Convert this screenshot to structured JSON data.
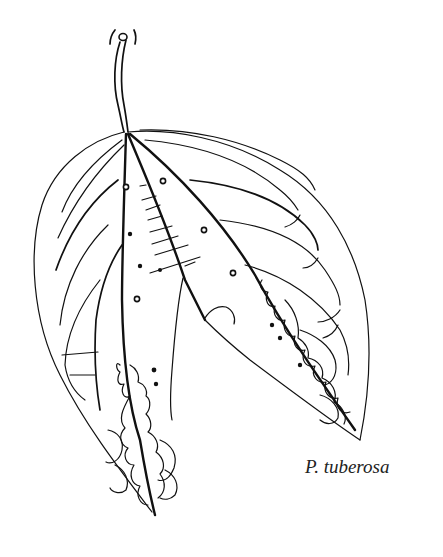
{
  "figure": {
    "caption": "P. tuberosa",
    "stroke_color": "#111111",
    "background_color": "#ffffff"
  }
}
